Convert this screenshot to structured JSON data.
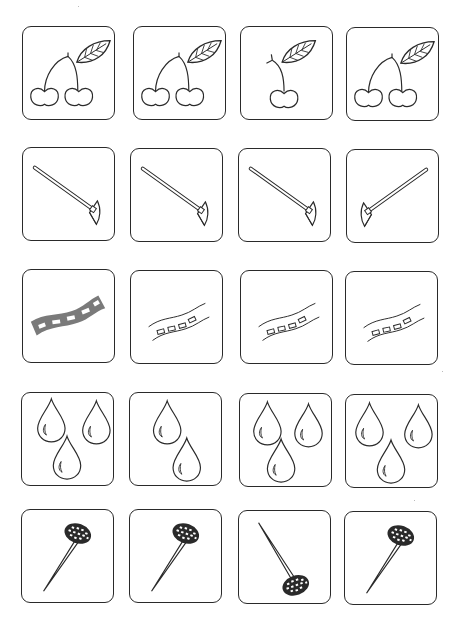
{
  "worksheet": {
    "type": "odd-one-out picture puzzle",
    "colors": {
      "stroke": "#2a2a2a",
      "road_fill": "#7a7a7a",
      "pin_head": "#2a2a2a"
    },
    "rows": [
      {
        "subject": "cherries",
        "cards": [
          {
            "variant": "two-cherries-with-leaf"
          },
          {
            "variant": "two-cherries-with-leaf"
          },
          {
            "variant": "one-cherry-with-leaf"
          },
          {
            "variant": "two-cherries-with-leaf"
          }
        ]
      },
      {
        "subject": "hoe",
        "cards": [
          {
            "variant": "hoe-pointing-right"
          },
          {
            "variant": "hoe-pointing-right"
          },
          {
            "variant": "hoe-pointing-right"
          },
          {
            "variant": "hoe-pointing-left"
          }
        ]
      },
      {
        "subject": "road",
        "cards": [
          {
            "variant": "road-filled-gray"
          },
          {
            "variant": "road-outline"
          },
          {
            "variant": "road-outline"
          },
          {
            "variant": "road-outline"
          }
        ]
      },
      {
        "subject": "water-drops",
        "cards": [
          {
            "variant": "three-drops"
          },
          {
            "variant": "two-drops"
          },
          {
            "variant": "three-drops"
          },
          {
            "variant": "three-drops"
          }
        ]
      },
      {
        "subject": "pin",
        "cards": [
          {
            "variant": "pin-head-up"
          },
          {
            "variant": "pin-head-up"
          },
          {
            "variant": "pin-head-down"
          },
          {
            "variant": "pin-head-up"
          }
        ]
      }
    ]
  }
}
